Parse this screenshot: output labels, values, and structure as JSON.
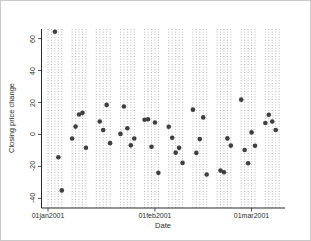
{
  "window": {
    "background": "#ffffff",
    "border_color": "#c9c9c9"
  },
  "chart_data": {
    "type": "scatter",
    "title": "",
    "xlabel": "Date",
    "ylabel": "Closing price change",
    "legend": "none",
    "grid": "vertical-dotted-weekdays-only",
    "marker_color": "#3f3f3f",
    "grid_color": "#9a9a9a",
    "axis_color": "#2b2b2b",
    "ylim": [
      -46,
      66
    ],
    "xlim": [
      "2001-01-01",
      "2001-03-11"
    ],
    "y_ticks": [
      -40,
      -20,
      0,
      20,
      40,
      60
    ],
    "x_ticks": [
      {
        "date": "2001-01-01",
        "label": "01jan2001"
      },
      {
        "date": "2001-02-01",
        "label": "01feb2001"
      },
      {
        "date": "2001-03-01",
        "label": "01mar2001"
      }
    ],
    "points": [
      {
        "date": "2001-01-03",
        "change": 64.29
      },
      {
        "date": "2001-01-04",
        "change": -14.22
      },
      {
        "date": "2001-01-05",
        "change": -34.99
      },
      {
        "date": "2001-01-08",
        "change": -2.49
      },
      {
        "date": "2001-01-09",
        "change": 4.94
      },
      {
        "date": "2001-01-10",
        "change": 12.47
      },
      {
        "date": "2001-01-11",
        "change": 13.55
      },
      {
        "date": "2001-01-12",
        "change": -8.27
      },
      {
        "date": "2001-01-16",
        "change": 8.1
      },
      {
        "date": "2001-01-17",
        "change": 2.82
      },
      {
        "date": "2001-01-18",
        "change": 18.5
      },
      {
        "date": "2001-01-19",
        "change": -5.43
      },
      {
        "date": "2001-01-22",
        "change": 0.36
      },
      {
        "date": "2001-01-23",
        "change": 17.5
      },
      {
        "date": "2001-01-24",
        "change": 3.9
      },
      {
        "date": "2001-01-25",
        "change": -6.79
      },
      {
        "date": "2001-01-26",
        "change": -2.56
      },
      {
        "date": "2001-01-29",
        "change": 9.22
      },
      {
        "date": "2001-01-30",
        "change": 9.56
      },
      {
        "date": "2001-01-31",
        "change": -7.72
      },
      {
        "date": "2001-02-01",
        "change": 7.46
      },
      {
        "date": "2001-02-02",
        "change": -24.0
      },
      {
        "date": "2001-02-05",
        "change": 4.84
      },
      {
        "date": "2001-02-06",
        "change": -2.05
      },
      {
        "date": "2001-02-07",
        "change": -11.37
      },
      {
        "date": "2001-02-08",
        "change": -8.36
      },
      {
        "date": "2001-02-09",
        "change": -17.77
      },
      {
        "date": "2001-02-12",
        "change": 15.55
      },
      {
        "date": "2001-02-13",
        "change": -11.51
      },
      {
        "date": "2001-02-14",
        "change": -2.88
      },
      {
        "date": "2001-02-15",
        "change": 10.69
      },
      {
        "date": "2001-02-16",
        "change": -25.08
      },
      {
        "date": "2001-02-20",
        "change": -22.59
      },
      {
        "date": "2001-02-21",
        "change": -23.67
      },
      {
        "date": "2001-02-22",
        "change": -2.45
      },
      {
        "date": "2001-02-23",
        "change": -6.96
      },
      {
        "date": "2001-02-26",
        "change": 21.79
      },
      {
        "date": "2001-02-27",
        "change": -9.71
      },
      {
        "date": "2001-02-28",
        "change": -18.0
      },
      {
        "date": "2001-03-01",
        "change": 1.29
      },
      {
        "date": "2001-03-02",
        "change": -7.05
      },
      {
        "date": "2001-03-05",
        "change": 7.23
      },
      {
        "date": "2001-03-06",
        "change": 12.39
      },
      {
        "date": "2001-03-07",
        "change": 8.09
      },
      {
        "date": "2001-03-08",
        "change": 2.85
      }
    ]
  }
}
